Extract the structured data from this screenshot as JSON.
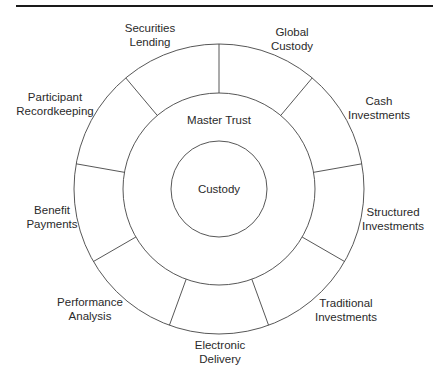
{
  "diagram": {
    "type": "concentric-ring",
    "center": {
      "label": "Custody"
    },
    "middle_ring": {
      "label": "Master Trust"
    },
    "outer_segments": [
      {
        "lines": [
          "Securities",
          "Lending"
        ]
      },
      {
        "lines": [
          "Global",
          "Custody"
        ]
      },
      {
        "lines": [
          "Cash",
          "Investments"
        ]
      },
      {
        "lines": [
          "Structured",
          "Investments"
        ]
      },
      {
        "lines": [
          "Traditional",
          "Investments"
        ]
      },
      {
        "lines": [
          "Electronic",
          "Delivery"
        ]
      },
      {
        "lines": [
          "Performance",
          "Analysis"
        ]
      },
      {
        "lines": [
          "Benefit",
          "Payments"
        ]
      },
      {
        "lines": [
          "Participant",
          "Recordkeeping"
        ]
      }
    ]
  },
  "colors": {
    "line": "#444444",
    "text": "#2a2a2a",
    "rule": "#1a1a1a",
    "background": "#ffffff"
  }
}
